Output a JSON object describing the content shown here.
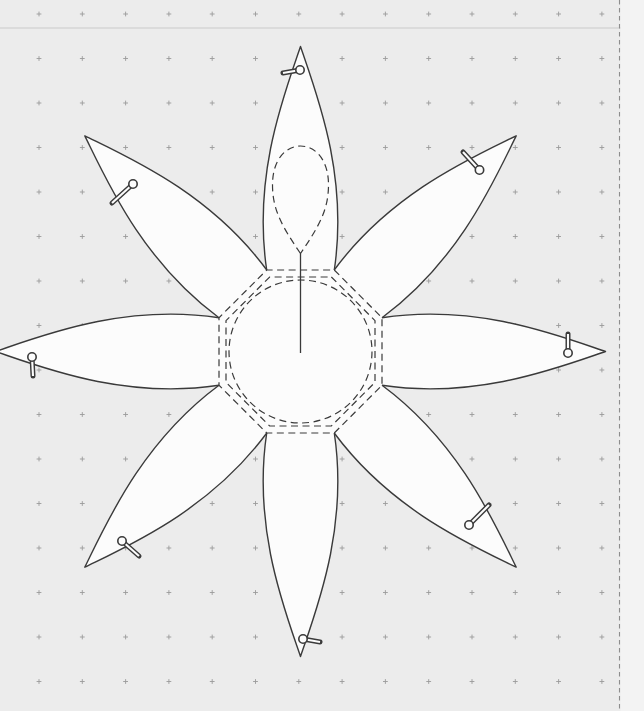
{
  "canvas": {
    "width": 644,
    "height": 711,
    "background_color": "#ececec",
    "crease_line": {
      "y": 28,
      "color": "#b9b9b9",
      "opacity": 0.45
    }
  },
  "dot_grid": {
    "glyph": "plus",
    "origin_x": 39,
    "origin_y": 14,
    "spacing_x": 43.3,
    "spacing_y": 44.5,
    "max_x": 612,
    "arm": 2.4,
    "color": "#9b9b9b"
  },
  "page_margin": {
    "line_x": 619.5,
    "line_color": "#8d8d8d",
    "strip_color": "#f3f3f3"
  },
  "flower_pattern": {
    "center": {
      "x": 300.5,
      "y": 351.5
    },
    "outline_color": "#3a3a3a",
    "fill_color": "#fcfcfc",
    "guide_color": "#3a3a3a",
    "petals": {
      "count": 8,
      "angles_deg": [
        0,
        45,
        90,
        135,
        180,
        225,
        270,
        315
      ],
      "names": [
        "north",
        "northeast",
        "east",
        "southeast",
        "south",
        "southwest",
        "west",
        "northwest"
      ],
      "base_apothem": 81.5,
      "base_half_width": 33.8,
      "tip_radius": 305,
      "ctrl1": {
        "x": 48,
        "y": 176.5
      },
      "ctrl2": {
        "x": 16,
        "y": 258
      }
    },
    "center_guides": {
      "outer_octagon_apothem": 81.5,
      "inner_octagon_apothem": 74.5,
      "circle_radius": 71.5
    },
    "teardrop_guide": {
      "bottom_x": 300.5,
      "bottom_y": 253.5,
      "height": 107.5,
      "half_width": 28
    },
    "placement_line": {
      "x": 300.5,
      "y1": 253.5,
      "y2": 353
    },
    "pins": [
      {
        "petal": "north",
        "head": {
          "x": 300,
          "y": 70
        },
        "tail": {
          "x": 283,
          "y": 73
        }
      },
      {
        "petal": "northeast",
        "head": {
          "x": 479.5,
          "y": 170
        },
        "tail": {
          "x": 463,
          "y": 152
        }
      },
      {
        "petal": "east",
        "head": {
          "x": 568,
          "y": 353
        },
        "tail": {
          "x": 568,
          "y": 334
        }
      },
      {
        "petal": "southeast",
        "head": {
          "x": 469,
          "y": 525
        },
        "tail": {
          "x": 489,
          "y": 505
        }
      },
      {
        "petal": "south",
        "head": {
          "x": 303,
          "y": 639
        },
        "tail": {
          "x": 320,
          "y": 642
        }
      },
      {
        "petal": "southwest",
        "head": {
          "x": 122,
          "y": 541
        },
        "tail": {
          "x": 139,
          "y": 556
        }
      },
      {
        "petal": "west",
        "head": {
          "x": 32,
          "y": 357
        },
        "tail": {
          "x": 33,
          "y": 376
        }
      },
      {
        "petal": "northwest",
        "head": {
          "x": 133,
          "y": 184
        },
        "tail": {
          "x": 112,
          "y": 203
        }
      }
    ],
    "pin_style": {
      "head_radius": 4.2,
      "stem_width": 5,
      "stem_core_width": 2.1
    }
  }
}
